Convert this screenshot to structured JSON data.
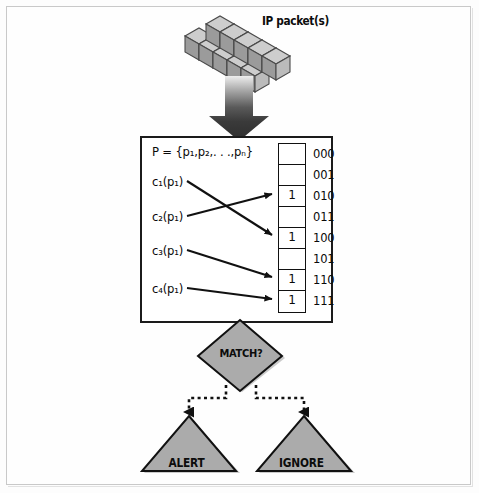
{
  "diagram": {
    "title_text": "IP packet(s)",
    "input": {
      "label": "IP packet(s)",
      "icon": "stacked-cubes-icon",
      "cube_rows": 2,
      "cube_cols": 5
    },
    "flow_arrow": {
      "icon": "thick-down-arrow-icon",
      "direction": "down"
    },
    "processing_box": {
      "set_formula": "P = {p₁,p₂,. . .,pₙ}",
      "hash_functions": [
        {
          "label": "c₁(p₁)",
          "maps_to_index": "100"
        },
        {
          "label": "c₂(p₁)",
          "maps_to_index": "010"
        },
        {
          "label": "c₃(p₁)",
          "maps_to_index": "110"
        },
        {
          "label": "c₄(p₁)",
          "maps_to_index": "111"
        }
      ],
      "bit_vector": {
        "cells": [
          {
            "index": "000",
            "value": ""
          },
          {
            "index": "001",
            "value": ""
          },
          {
            "index": "010",
            "value": "1"
          },
          {
            "index": "011",
            "value": ""
          },
          {
            "index": "100",
            "value": "1"
          },
          {
            "index": "101",
            "value": ""
          },
          {
            "index": "110",
            "value": "1"
          },
          {
            "index": "111",
            "value": "1"
          }
        ]
      }
    },
    "decision": {
      "label": "MATCH?",
      "shape": "diamond"
    },
    "outcomes": [
      {
        "label": "ALERT",
        "shape": "triangle"
      },
      {
        "label": "IGNORE",
        "shape": "triangle"
      }
    ],
    "colors": {
      "outline": "#111111",
      "shape_fill": "#a9a9a9",
      "cube_top": "#cfcfcf",
      "cube_left": "#9a9a9a",
      "cube_right": "#bcbcbc",
      "arrow_dark": "#3a3a3a",
      "page_background": "#fdfdfd",
      "frame_border": "#c9c9c9"
    }
  }
}
